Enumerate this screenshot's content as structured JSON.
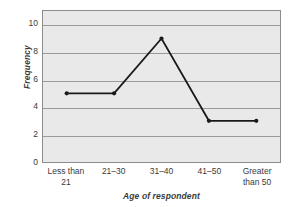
{
  "chart_data": {
    "type": "line",
    "title": "",
    "subtitle": "",
    "xlabel": "Age of respondent",
    "ylabel": "Frequency",
    "categories": [
      "Less than 21",
      "21–30",
      "31–40",
      "41–50",
      "Greater than 50"
    ],
    "category_lines": [
      [
        "Less than",
        "21"
      ],
      [
        "21–30",
        ""
      ],
      [
        "31–40",
        ""
      ],
      [
        "41–50",
        ""
      ],
      [
        "Greater",
        "than 50"
      ]
    ],
    "values": [
      5,
      5,
      9,
      3,
      3
    ],
    "series": [
      {
        "name": "Frequency",
        "values": [
          5,
          5,
          9,
          3,
          3
        ]
      }
    ],
    "ylim": [
      0,
      11
    ],
    "yticks": [
      0,
      2,
      4,
      6,
      8,
      10
    ],
    "ytick_labels": [
      "0",
      "2",
      "4",
      "6",
      "8",
      "10"
    ],
    "grid": "horizontal",
    "legend": "none",
    "marker": "filled-circle",
    "colors": {
      "line": "#1a1a1a",
      "marker": "#1a1a1a",
      "plot_background": "#e9e9e9",
      "gridline": "#9a9a9a",
      "frame": "#8d8d8d",
      "text": "#3a3a3a",
      "figure_background": "#ffffff"
    }
  }
}
